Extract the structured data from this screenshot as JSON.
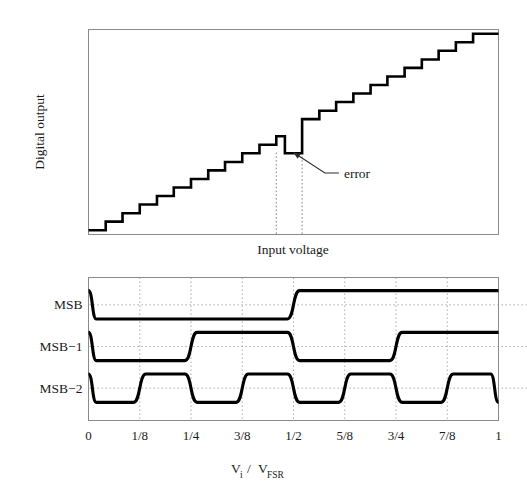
{
  "figure": {
    "background": "#ffffff",
    "ink": "#000000",
    "frame_color": "#8a8a8a",
    "grid_color": "#9b9b9b"
  },
  "chart_data": [
    {
      "id": "adc-transfer-function",
      "type": "line",
      "title": "",
      "xlabel": "Input voltage",
      "ylabel": "Digital output",
      "xlim": [
        0,
        1
      ],
      "ylim": [
        0,
        1
      ],
      "grid": false,
      "x_ticks": [],
      "y_ticks": [],
      "step_count": 24,
      "description": "Ideal ADC staircase transfer curve containing one non-monotonic code error near mid-scale",
      "series": [
        {
          "name": "digital output",
          "kind": "staircase",
          "points": [
            [
              0.0,
              0.021
            ],
            [
              0.042,
              0.021
            ],
            [
              0.042,
              0.063
            ],
            [
              0.083,
              0.063
            ],
            [
              0.083,
              0.104
            ],
            [
              0.125,
              0.104
            ],
            [
              0.125,
              0.146
            ],
            [
              0.167,
              0.146
            ],
            [
              0.167,
              0.188
            ],
            [
              0.208,
              0.188
            ],
            [
              0.208,
              0.229
            ],
            [
              0.25,
              0.229
            ],
            [
              0.25,
              0.271
            ],
            [
              0.292,
              0.271
            ],
            [
              0.292,
              0.313
            ],
            [
              0.333,
              0.313
            ],
            [
              0.333,
              0.354
            ],
            [
              0.375,
              0.354
            ],
            [
              0.375,
              0.396
            ],
            [
              0.417,
              0.396
            ],
            [
              0.417,
              0.438
            ],
            [
              0.458,
              0.438
            ],
            [
              0.458,
              0.479
            ],
            [
              0.479,
              0.479
            ],
            [
              0.479,
              0.396
            ],
            [
              0.521,
              0.396
            ],
            [
              0.521,
              0.563
            ],
            [
              0.563,
              0.563
            ],
            [
              0.563,
              0.604
            ],
            [
              0.604,
              0.604
            ],
            [
              0.604,
              0.646
            ],
            [
              0.646,
              0.646
            ],
            [
              0.646,
              0.688
            ],
            [
              0.688,
              0.688
            ],
            [
              0.688,
              0.729
            ],
            [
              0.729,
              0.729
            ],
            [
              0.729,
              0.771
            ],
            [
              0.771,
              0.771
            ],
            [
              0.771,
              0.813
            ],
            [
              0.813,
              0.813
            ],
            [
              0.813,
              0.854
            ],
            [
              0.854,
              0.854
            ],
            [
              0.854,
              0.896
            ],
            [
              0.896,
              0.896
            ],
            [
              0.896,
              0.938
            ],
            [
              0.938,
              0.938
            ],
            [
              0.938,
              0.979
            ],
            [
              1.0,
              0.979
            ]
          ]
        }
      ],
      "annotations": [
        {
          "name": "error",
          "label": "error",
          "target_x": 0.5,
          "target_y": 0.4,
          "label_x": 0.64,
          "label_y": 0.3
        }
      ],
      "error_markers_x": [
        0.458,
        0.521
      ]
    },
    {
      "id": "msb-bit-waveforms",
      "type": "line",
      "title": "",
      "xlabel": "Vi / VFSR",
      "xlabel_parts": {
        "v1": "V",
        "sub1": "i",
        "slash": "/",
        "v2": "V",
        "sub2": "FSR"
      },
      "ylabel": "",
      "xlim": [
        0,
        1
      ],
      "ylim": [
        0,
        1
      ],
      "grid": true,
      "grid_axis": "x",
      "x_ticks": [
        0,
        0.125,
        0.25,
        0.375,
        0.5,
        0.625,
        0.75,
        0.875,
        1
      ],
      "x_tick_labels": [
        "0",
        "1/8",
        "1/4",
        "3/8",
        "1/2",
        "5/8",
        "3/4",
        "7/8",
        "1"
      ],
      "row_labels": [
        "MSB",
        "MSB−1",
        "MSB−2"
      ],
      "transition_width": 0.03,
      "series": [
        {
          "name": "MSB",
          "row": 0,
          "threshold_level": 0.5,
          "start_level": 1,
          "transitions": [
            0.0,
            0.5
          ],
          "edges": [
            {
              "x": 0.004,
              "to": 0
            },
            {
              "x": 0.5,
              "to": 1
            }
          ]
        },
        {
          "name": "MSB−1",
          "row": 1,
          "threshold_level": 0.5,
          "start_level": 1,
          "transitions": [
            0.0,
            0.25,
            0.5,
            0.75
          ],
          "edges": [
            {
              "x": 0.004,
              "to": 0
            },
            {
              "x": 0.25,
              "to": 1
            },
            {
              "x": 0.5,
              "to": 0
            },
            {
              "x": 0.75,
              "to": 1
            }
          ]
        },
        {
          "name": "MSB−2",
          "row": 2,
          "threshold_level": 0.5,
          "start_level": 1,
          "transitions": [
            0.0,
            0.125,
            0.25,
            0.375,
            0.5,
            0.625,
            0.75,
            0.875,
            1.0
          ],
          "edges": [
            {
              "x": 0.004,
              "to": 0
            },
            {
              "x": 0.125,
              "to": 1
            },
            {
              "x": 0.25,
              "to": 0
            },
            {
              "x": 0.375,
              "to": 1
            },
            {
              "x": 0.5,
              "to": 0
            },
            {
              "x": 0.625,
              "to": 1
            },
            {
              "x": 0.75,
              "to": 0
            },
            {
              "x": 0.875,
              "to": 1
            },
            {
              "x": 0.996,
              "to": 0
            }
          ]
        }
      ]
    }
  ],
  "top_panel": {
    "ylabel": "Digital output",
    "xlabel": "Input voltage",
    "error_label": "error"
  },
  "bottom_panel": {
    "row_labels": [
      "MSB",
      "MSB−1",
      "MSB−2"
    ],
    "tick_labels": [
      "0",
      "1/8",
      "1/4",
      "3/8",
      "1/2",
      "5/8",
      "3/4",
      "7/8",
      "1"
    ],
    "xlabel_v": "V",
    "xlabel_sub_i": "i",
    "xlabel_slash": "/",
    "xlabel_v2": "V",
    "xlabel_sub_fsr": "FSR"
  }
}
